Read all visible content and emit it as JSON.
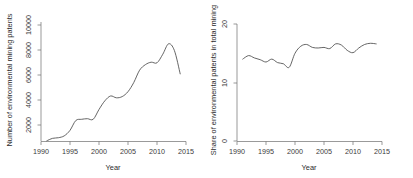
{
  "figure": {
    "width": 413,
    "height": 178,
    "background": "#ffffff",
    "line_color": "#4a4a4a",
    "axis_color": "#6e6e6e"
  },
  "chart_data": [
    {
      "type": "line",
      "panel": "left",
      "title": "",
      "xlabel": "Year",
      "ylabel": "Number of environmental mining patents",
      "xlim": [
        1990,
        2015
      ],
      "ylim": [
        1600,
        10700
      ],
      "grid": false,
      "legend": null,
      "xticks": [
        1990,
        1995,
        2000,
        2005,
        2010,
        2015
      ],
      "yticks": [
        2000,
        4000,
        6000,
        8000,
        10000
      ],
      "x": [
        1991,
        1992,
        1993,
        1994,
        1995,
        1996,
        1997,
        1998,
        1999,
        2000,
        2001,
        2002,
        2003,
        2004,
        2005,
        2006,
        2007,
        2008,
        2009,
        2010,
        2011,
        2012,
        2013,
        2014
      ],
      "values": [
        2350,
        2550,
        2600,
        2750,
        3200,
        4000,
        4100,
        4150,
        4100,
        4900,
        5600,
        6000,
        5850,
        5950,
        6350,
        7100,
        8100,
        8550,
        8750,
        8700,
        9400,
        10250,
        9700,
        7800
      ]
    },
    {
      "type": "line",
      "panel": "right",
      "title": "",
      "xlabel": "Year",
      "ylabel": "Share of environmental patents in total mining",
      "xlim": [
        1990,
        2015
      ],
      "ylim": [
        0,
        21
      ],
      "grid": false,
      "legend": null,
      "xticks": [
        1990,
        1995,
        2000,
        2005,
        2010,
        2015
      ],
      "yticks": [
        0,
        10,
        20
      ],
      "x": [
        1991,
        1992,
        1993,
        1994,
        1995,
        1996,
        1997,
        1998,
        1999,
        2000,
        2001,
        2002,
        2003,
        2004,
        2005,
        2006,
        2007,
        2008,
        2009,
        2010,
        2011,
        2012,
        2013,
        2014
      ],
      "values": [
        14.0,
        14.6,
        14.2,
        13.9,
        13.5,
        14.0,
        13.4,
        13.2,
        12.6,
        15.0,
        16.2,
        16.5,
        16.0,
        15.9,
        16.0,
        15.8,
        16.6,
        16.4,
        15.5,
        15.1,
        15.9,
        16.5,
        16.7,
        16.6
      ]
    }
  ]
}
